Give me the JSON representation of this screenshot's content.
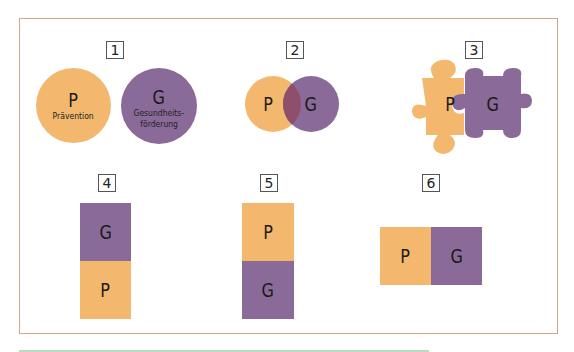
{
  "colors": {
    "p": "#f3b86e",
    "g": "#8a6a98",
    "overlap": "#8e4f6a",
    "frame": "#e0a088",
    "rule": "#b8dcc0"
  },
  "panels": [
    {
      "number": "1",
      "p": {
        "letter": "P",
        "label": "Prävention"
      },
      "g": {
        "letter": "G",
        "label_line1": "Gesundheits-",
        "label_line2": "förderung"
      }
    },
    {
      "number": "2",
      "p": {
        "letter": "P"
      },
      "g": {
        "letter": "G"
      }
    },
    {
      "number": "3",
      "p": {
        "letter": "P"
      },
      "g": {
        "letter": "G"
      }
    },
    {
      "number": "4",
      "top": {
        "letter": "G"
      },
      "bottom": {
        "letter": "P"
      }
    },
    {
      "number": "5",
      "top": {
        "letter": "P"
      },
      "bottom": {
        "letter": "G"
      }
    },
    {
      "number": "6",
      "left": {
        "letter": "P"
      },
      "right": {
        "letter": "G"
      }
    }
  ]
}
